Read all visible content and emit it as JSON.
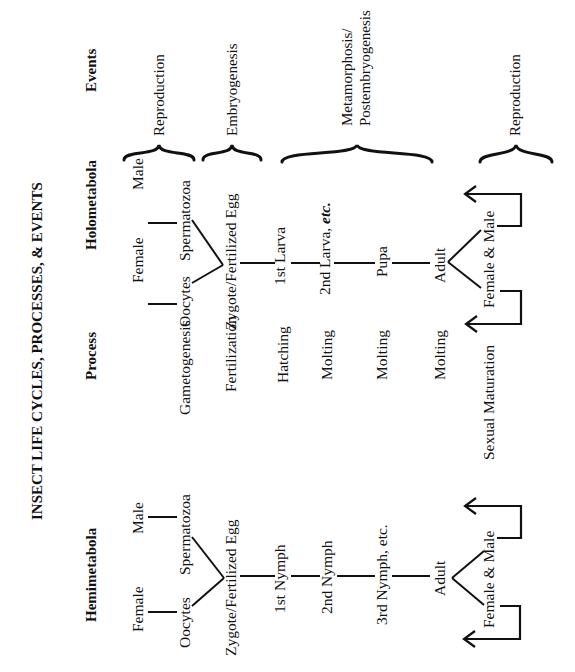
{
  "title": "INSECT LIFE CYCLES, PROCESSES, & EVENTS",
  "columns": {
    "hemimetabola": "Hemimetabola",
    "process": "Process",
    "holometabola": "Holometabola",
    "events": "Events"
  },
  "hemimetabola": {
    "female": "Female",
    "male": "Male",
    "oocytes": "Oocytes",
    "spermatozoa": "Spermatozoa",
    "zygote": "Zygote/Fertilized Egg",
    "stages": [
      "1st Nymph",
      "2nd Nymph",
      "3rd Nymph, etc.",
      "Adult"
    ],
    "offspring": "Female & Male"
  },
  "process": [
    "Gametogenesis",
    "Fertilization",
    "Hatching",
    "Molting",
    "Molting",
    "Molting",
    "Sexual Maturation"
  ],
  "holometabola": {
    "female": "Female",
    "male": "Male",
    "oocytes": "Oocytes",
    "spermatozoa": "Spermatozoa",
    "zygote": "Zygote/Fertilized Egg",
    "stages": [
      "1st Larva",
      "2nd Larva, ",
      "Pupa",
      "Adult"
    ],
    "stage2_italic": "etc.",
    "offspring": "Female & Male"
  },
  "events": {
    "reproduction_1": "Reproduction",
    "embryogenesis": "Embryogenesis",
    "metamorphosis_line1": "Metamorphosis/",
    "metamorphosis_line2": "Postembryogenesis",
    "reproduction_2": "Reproduction"
  }
}
